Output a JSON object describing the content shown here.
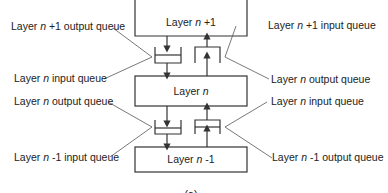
{
  "diagram": {
    "layers": [
      {
        "id": "upper",
        "prefix": "Layer ",
        "var": "n",
        "suffix": " +1"
      },
      {
        "id": "middle",
        "prefix": "Layer ",
        "var": "n",
        "suffix": ""
      },
      {
        "id": "lower",
        "prefix": "Layer ",
        "var": "n",
        "suffix": " -1"
      }
    ],
    "labels": {
      "top_left_1": {
        "prefix": "Layer ",
        "var": "n",
        "suffix": " +1 output queue"
      },
      "top_left_2": {
        "prefix": "Layer ",
        "var": "n",
        "suffix": " input queue"
      },
      "top_right_1": {
        "prefix": "Layer ",
        "var": "n",
        "suffix": " +1 input queue"
      },
      "top_right_2": {
        "prefix": "Layer ",
        "var": "n",
        "suffix": " output queue"
      },
      "bottom_left_1": {
        "prefix": "Layer ",
        "var": "n",
        "suffix": " output queue"
      },
      "bottom_left_2": {
        "prefix": "Layer ",
        "var": "n",
        "suffix": " -1 input queue"
      },
      "bottom_right_1": {
        "prefix": "Layer ",
        "var": "n",
        "suffix": " input queue"
      },
      "bottom_right_2": {
        "prefix": "Layer ",
        "var": "n",
        "suffix": " -1 output queue"
      }
    },
    "caption": "(a)",
    "colors": {
      "line": "#333333",
      "text": "#222222",
      "background": "#ffffff"
    }
  }
}
